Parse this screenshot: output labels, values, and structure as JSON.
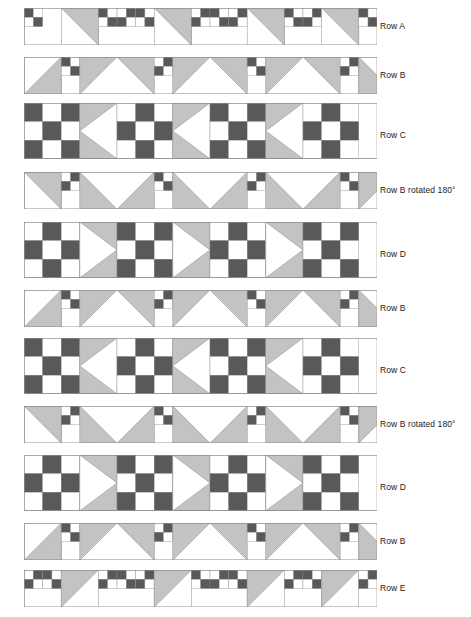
{
  "diagram": {
    "unit_px": 18.6,
    "strip_left_px": 24,
    "label_left_px": 380,
    "palette": {
      "dark": "#595959",
      "light_gray": "#c9c9c9",
      "white": "#ffffff",
      "outline": "#8c8c8c",
      "label_text": "#1a1a1a",
      "background": "#ffffff"
    },
    "legend_note": "Each strip is built from 4-patch, 9-patch, half-square-triangle, peak and arrow units.",
    "rows": [
      {
        "id": "row-a",
        "label": "Row A",
        "height_units": 2,
        "width_units": 19,
        "top_px": 8,
        "label_top_px": 22,
        "repeat": "four-patch + half-square-triangle",
        "units": [
          {
            "type": "four-patch",
            "x": 0,
            "tl": "dark",
            "tr": "white",
            "bl": "white",
            "br": "dark"
          },
          {
            "type": "hst",
            "x": 2,
            "w": 2,
            "dir": "tr",
            "fill": "light_gray"
          },
          {
            "type": "four-patch",
            "x": 4,
            "tl": "dark",
            "tr": "white",
            "bl": "white",
            "br": "dark"
          },
          {
            "type": "four-patch",
            "x": 5,
            "tl": "white",
            "tr": "dark",
            "bl": "dark",
            "br": "white"
          },
          {
            "type": "four-patch",
            "x": 6,
            "tl": "dark",
            "tr": "white",
            "bl": "white",
            "br": "dark"
          },
          {
            "type": "hst",
            "x": 7,
            "w": 2,
            "dir": "tr",
            "fill": "light_gray"
          },
          {
            "type": "four-patch",
            "x": 9,
            "tl": "white",
            "tr": "dark",
            "bl": "dark",
            "br": "white"
          },
          {
            "type": "four-patch",
            "x": 10,
            "tl": "dark",
            "tr": "white",
            "bl": "white",
            "br": "dark"
          },
          {
            "type": "four-patch",
            "x": 11,
            "tl": "white",
            "tr": "dark",
            "bl": "dark",
            "br": "white"
          },
          {
            "type": "hst",
            "x": 12,
            "w": 2,
            "dir": "tr",
            "fill": "light_gray"
          },
          {
            "type": "four-patch",
            "x": 14,
            "tl": "dark",
            "tr": "white",
            "bl": "white",
            "br": "dark"
          },
          {
            "type": "four-patch",
            "x": 15,
            "tl": "white",
            "tr": "dark",
            "bl": "dark",
            "br": "white"
          },
          {
            "type": "hst",
            "x": 16,
            "w": 2,
            "dir": "tr",
            "fill": "light_gray"
          },
          {
            "type": "four-patch",
            "x": 18,
            "tl": "dark",
            "tr": "white",
            "bl": "white",
            "br": "dark"
          }
        ]
      },
      {
        "id": "row-b-1",
        "label": "Row B",
        "height_units": 2,
        "width_units": 19,
        "top_px": 57,
        "label_top_px": 71,
        "repeat": "half-square-triangle + four-patch + peak",
        "units": [
          {
            "type": "hst",
            "x": 0,
            "w": 2,
            "dir": "br",
            "fill": "light_gray"
          },
          {
            "type": "four-patch",
            "x": 2,
            "tl": "dark",
            "tr": "white",
            "bl": "white",
            "br": "dark"
          },
          {
            "type": "peak",
            "x": 3,
            "w": 4,
            "dir": "up",
            "fill": "light_gray"
          },
          {
            "type": "four-patch",
            "x": 7,
            "tl": "white",
            "tr": "dark",
            "bl": "dark",
            "br": "white"
          },
          {
            "type": "peak",
            "x": 8,
            "w": 4,
            "dir": "up",
            "fill": "light_gray"
          },
          {
            "type": "four-patch",
            "x": 12,
            "tl": "dark",
            "tr": "white",
            "bl": "white",
            "br": "dark"
          },
          {
            "type": "peak",
            "x": 13,
            "w": 4,
            "dir": "up",
            "fill": "light_gray"
          },
          {
            "type": "four-patch",
            "x": 17,
            "tl": "white",
            "tr": "dark",
            "bl": "dark",
            "br": "white"
          },
          {
            "type": "hst",
            "x": 18,
            "w": 2,
            "dir": "bl",
            "fill": "light_gray"
          }
        ]
      },
      {
        "id": "row-c-1",
        "label": "Row C",
        "height_units": 3,
        "width_units": 19,
        "top_px": 103,
        "label_top_px": 131,
        "repeat": "nine-patch + arrow-left",
        "units": [
          {
            "type": "nine-patch",
            "x": 0,
            "variant": "dark-corners"
          },
          {
            "type": "arrow",
            "x": 3,
            "dir": "left",
            "fill": "light_gray"
          },
          {
            "type": "nine-patch",
            "x": 5,
            "variant": "dark-center"
          },
          {
            "type": "arrow",
            "x": 8,
            "dir": "left",
            "fill": "light_gray"
          },
          {
            "type": "nine-patch",
            "x": 10,
            "variant": "dark-corners"
          },
          {
            "type": "arrow",
            "x": 13,
            "dir": "left",
            "fill": "light_gray"
          },
          {
            "type": "nine-patch",
            "x": 15,
            "variant": "dark-center"
          }
        ]
      },
      {
        "id": "row-b-rot-1",
        "label": "Row B rotated 180°",
        "height_units": 2,
        "width_units": 19,
        "top_px": 172,
        "label_top_px": 186,
        "repeat": "half-square-triangle + four-patch + valley",
        "units": [
          {
            "type": "hst",
            "x": 0,
            "w": 2,
            "dir": "tr",
            "fill": "light_gray"
          },
          {
            "type": "four-patch",
            "x": 2,
            "tl": "white",
            "tr": "dark",
            "bl": "dark",
            "br": "white"
          },
          {
            "type": "peak",
            "x": 3,
            "w": 4,
            "dir": "down",
            "fill": "light_gray"
          },
          {
            "type": "four-patch",
            "x": 7,
            "tl": "dark",
            "tr": "white",
            "bl": "white",
            "br": "dark"
          },
          {
            "type": "peak",
            "x": 8,
            "w": 4,
            "dir": "down",
            "fill": "light_gray"
          },
          {
            "type": "four-patch",
            "x": 12,
            "tl": "white",
            "tr": "dark",
            "bl": "dark",
            "br": "white"
          },
          {
            "type": "peak",
            "x": 13,
            "w": 4,
            "dir": "down",
            "fill": "light_gray"
          },
          {
            "type": "four-patch",
            "x": 17,
            "tl": "dark",
            "tr": "white",
            "bl": "white",
            "br": "dark"
          },
          {
            "type": "hst",
            "x": 18,
            "w": 2,
            "dir": "tl",
            "fill": "light_gray"
          }
        ]
      },
      {
        "id": "row-d-1",
        "label": "Row D",
        "height_units": 3,
        "width_units": 19,
        "top_px": 222,
        "label_top_px": 250,
        "repeat": "nine-patch + arrow-right",
        "units": [
          {
            "type": "nine-patch",
            "x": 0,
            "variant": "dark-center"
          },
          {
            "type": "arrow",
            "x": 3,
            "dir": "right",
            "fill": "light_gray"
          },
          {
            "type": "nine-patch",
            "x": 5,
            "variant": "dark-corners"
          },
          {
            "type": "arrow",
            "x": 8,
            "dir": "right",
            "fill": "light_gray"
          },
          {
            "type": "nine-patch",
            "x": 10,
            "variant": "dark-center"
          },
          {
            "type": "arrow",
            "x": 13,
            "dir": "right",
            "fill": "light_gray"
          },
          {
            "type": "nine-patch",
            "x": 15,
            "variant": "dark-corners"
          }
        ]
      },
      {
        "id": "row-b-2",
        "label": "Row B",
        "height_units": 2,
        "width_units": 19,
        "top_px": 290,
        "label_top_px": 304,
        "repeat": "half-square-triangle + four-patch + peak",
        "units": [
          {
            "type": "hst",
            "x": 0,
            "w": 2,
            "dir": "br",
            "fill": "light_gray"
          },
          {
            "type": "four-patch",
            "x": 2,
            "tl": "dark",
            "tr": "white",
            "bl": "white",
            "br": "dark"
          },
          {
            "type": "peak",
            "x": 3,
            "w": 4,
            "dir": "up",
            "fill": "light_gray"
          },
          {
            "type": "four-patch",
            "x": 7,
            "tl": "white",
            "tr": "dark",
            "bl": "dark",
            "br": "white"
          },
          {
            "type": "peak",
            "x": 8,
            "w": 4,
            "dir": "up",
            "fill": "light_gray"
          },
          {
            "type": "four-patch",
            "x": 12,
            "tl": "dark",
            "tr": "white",
            "bl": "white",
            "br": "dark"
          },
          {
            "type": "peak",
            "x": 13,
            "w": 4,
            "dir": "up",
            "fill": "light_gray"
          },
          {
            "type": "four-patch",
            "x": 17,
            "tl": "white",
            "tr": "dark",
            "bl": "dark",
            "br": "white"
          },
          {
            "type": "hst",
            "x": 18,
            "w": 2,
            "dir": "bl",
            "fill": "light_gray"
          }
        ]
      },
      {
        "id": "row-c-2",
        "label": "Row C",
        "height_units": 3,
        "width_units": 19,
        "top_px": 338,
        "label_top_px": 366,
        "repeat": "nine-patch + arrow-left",
        "units": [
          {
            "type": "nine-patch",
            "x": 0,
            "variant": "dark-corners"
          },
          {
            "type": "arrow",
            "x": 3,
            "dir": "left",
            "fill": "light_gray"
          },
          {
            "type": "nine-patch",
            "x": 5,
            "variant": "dark-center"
          },
          {
            "type": "arrow",
            "x": 8,
            "dir": "left",
            "fill": "light_gray"
          },
          {
            "type": "nine-patch",
            "x": 10,
            "variant": "dark-corners"
          },
          {
            "type": "arrow",
            "x": 13,
            "dir": "left",
            "fill": "light_gray"
          },
          {
            "type": "nine-patch",
            "x": 15,
            "variant": "dark-center"
          }
        ]
      },
      {
        "id": "row-b-rot-2",
        "label": "Row B rotated 180°",
        "height_units": 2,
        "width_units": 19,
        "top_px": 406,
        "label_top_px": 420,
        "repeat": "half-square-triangle + four-patch + valley",
        "units": [
          {
            "type": "hst",
            "x": 0,
            "w": 2,
            "dir": "tr",
            "fill": "light_gray"
          },
          {
            "type": "four-patch",
            "x": 2,
            "tl": "white",
            "tr": "dark",
            "bl": "dark",
            "br": "white"
          },
          {
            "type": "peak",
            "x": 3,
            "w": 4,
            "dir": "down",
            "fill": "light_gray"
          },
          {
            "type": "four-patch",
            "x": 7,
            "tl": "dark",
            "tr": "white",
            "bl": "white",
            "br": "dark"
          },
          {
            "type": "peak",
            "x": 8,
            "w": 4,
            "dir": "down",
            "fill": "light_gray"
          },
          {
            "type": "four-patch",
            "x": 12,
            "tl": "white",
            "tr": "dark",
            "bl": "dark",
            "br": "white"
          },
          {
            "type": "peak",
            "x": 13,
            "w": 4,
            "dir": "down",
            "fill": "light_gray"
          },
          {
            "type": "four-patch",
            "x": 17,
            "tl": "dark",
            "tr": "white",
            "bl": "white",
            "br": "dark"
          },
          {
            "type": "hst",
            "x": 18,
            "w": 2,
            "dir": "tl",
            "fill": "light_gray"
          }
        ]
      },
      {
        "id": "row-d-2",
        "label": "Row D",
        "height_units": 3,
        "width_units": 19,
        "top_px": 455,
        "label_top_px": 483,
        "repeat": "nine-patch + arrow-right",
        "units": [
          {
            "type": "nine-patch",
            "x": 0,
            "variant": "dark-center"
          },
          {
            "type": "arrow",
            "x": 3,
            "dir": "right",
            "fill": "light_gray"
          },
          {
            "type": "nine-patch",
            "x": 5,
            "variant": "dark-corners"
          },
          {
            "type": "arrow",
            "x": 8,
            "dir": "right",
            "fill": "light_gray"
          },
          {
            "type": "nine-patch",
            "x": 10,
            "variant": "dark-center"
          },
          {
            "type": "arrow",
            "x": 13,
            "dir": "right",
            "fill": "light_gray"
          },
          {
            "type": "nine-patch",
            "x": 15,
            "variant": "dark-corners"
          }
        ]
      },
      {
        "id": "row-b-3",
        "label": "Row B",
        "height_units": 2,
        "width_units": 19,
        "top_px": 523,
        "label_top_px": 537,
        "repeat": "half-square-triangle + four-patch + peak",
        "units": [
          {
            "type": "hst",
            "x": 0,
            "w": 2,
            "dir": "br",
            "fill": "light_gray"
          },
          {
            "type": "four-patch",
            "x": 2,
            "tl": "dark",
            "tr": "white",
            "bl": "white",
            "br": "dark"
          },
          {
            "type": "peak",
            "x": 3,
            "w": 4,
            "dir": "up",
            "fill": "light_gray"
          },
          {
            "type": "four-patch",
            "x": 7,
            "tl": "white",
            "tr": "dark",
            "bl": "dark",
            "br": "white"
          },
          {
            "type": "peak",
            "x": 8,
            "w": 4,
            "dir": "up",
            "fill": "light_gray"
          },
          {
            "type": "four-patch",
            "x": 12,
            "tl": "dark",
            "tr": "white",
            "bl": "white",
            "br": "dark"
          },
          {
            "type": "peak",
            "x": 13,
            "w": 4,
            "dir": "up",
            "fill": "light_gray"
          },
          {
            "type": "four-patch",
            "x": 17,
            "tl": "white",
            "tr": "dark",
            "bl": "dark",
            "br": "white"
          },
          {
            "type": "hst",
            "x": 18,
            "w": 2,
            "dir": "bl",
            "fill": "light_gray"
          }
        ]
      },
      {
        "id": "row-e",
        "label": "Row E",
        "height_units": 2,
        "width_units": 19,
        "top_px": 570,
        "label_top_px": 584,
        "repeat": "four-patch + half-square-triangle (mirrored)",
        "units": [
          {
            "type": "four-patch",
            "x": 0,
            "tl": "white",
            "tr": "dark",
            "bl": "dark",
            "br": "white"
          },
          {
            "type": "four-patch",
            "x": 1,
            "tl": "dark",
            "tr": "white",
            "bl": "white",
            "br": "dark"
          },
          {
            "type": "hst",
            "x": 2,
            "w": 2,
            "dir": "tl",
            "fill": "light_gray"
          },
          {
            "type": "four-patch",
            "x": 4,
            "tl": "white",
            "tr": "dark",
            "bl": "dark",
            "br": "white"
          },
          {
            "type": "four-patch",
            "x": 5,
            "tl": "dark",
            "tr": "white",
            "bl": "white",
            "br": "dark"
          },
          {
            "type": "four-patch",
            "x": 6,
            "tl": "white",
            "tr": "dark",
            "bl": "dark",
            "br": "white"
          },
          {
            "type": "hst",
            "x": 7,
            "w": 2,
            "dir": "tl",
            "fill": "light_gray"
          },
          {
            "type": "four-patch",
            "x": 9,
            "tl": "dark",
            "tr": "white",
            "bl": "white",
            "br": "dark"
          },
          {
            "type": "four-patch",
            "x": 10,
            "tl": "white",
            "tr": "dark",
            "bl": "dark",
            "br": "white"
          },
          {
            "type": "four-patch",
            "x": 11,
            "tl": "dark",
            "tr": "white",
            "bl": "white",
            "br": "dark"
          },
          {
            "type": "hst",
            "x": 12,
            "w": 2,
            "dir": "tl",
            "fill": "light_gray"
          },
          {
            "type": "four-patch",
            "x": 14,
            "tl": "white",
            "tr": "dark",
            "bl": "dark",
            "br": "white"
          },
          {
            "type": "four-patch",
            "x": 15,
            "tl": "dark",
            "tr": "white",
            "bl": "white",
            "br": "dark"
          },
          {
            "type": "hst",
            "x": 16,
            "w": 2,
            "dir": "tl",
            "fill": "light_gray"
          },
          {
            "type": "four-patch",
            "x": 18,
            "tl": "white",
            "tr": "dark",
            "bl": "dark",
            "br": "white"
          }
        ]
      }
    ]
  }
}
